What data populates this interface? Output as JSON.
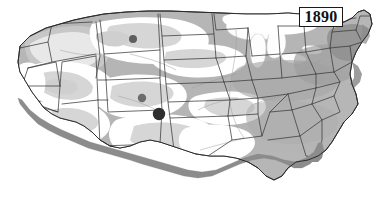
{
  "figure": {
    "kind": "historical-map",
    "region": "united-states-contiguous",
    "year_label": "1890",
    "background_color": "#ffffff"
  },
  "legend_colors": {
    "settled_dense": "#9a9a9a",
    "settled": "#b6b6b6",
    "sparse": "#d6d6d6",
    "unsettled": "#ffffff",
    "lakes": "#fdfdfd",
    "coast_shadow": "#8c8c8c",
    "state_border": "#3a3a3a",
    "outline": "#2b2b2b",
    "marker_dark": "#2e2e2e",
    "marker_mid": "#6d6d6d"
  },
  "year_box": {
    "text": "1890",
    "border_color": "#1a1a1a",
    "fill": "#ffffff"
  },
  "markers": [
    {
      "name": "marker-montana",
      "x": 133,
      "y": 39,
      "r": 4.0,
      "color": "#5e5e5e"
    },
    {
      "name": "marker-colorado",
      "x": 142,
      "y": 98,
      "r": 4.2,
      "color": "#6d6d6d"
    },
    {
      "name": "marker-new-mexico",
      "x": 159,
      "y": 114,
      "r": 6.2,
      "color": "#2e2e2e"
    }
  ],
  "map_features": {
    "great_lakes_label": "Great Lakes",
    "coast_shadow_label": "coastline-shadow",
    "outline_label": "national-outline"
  }
}
